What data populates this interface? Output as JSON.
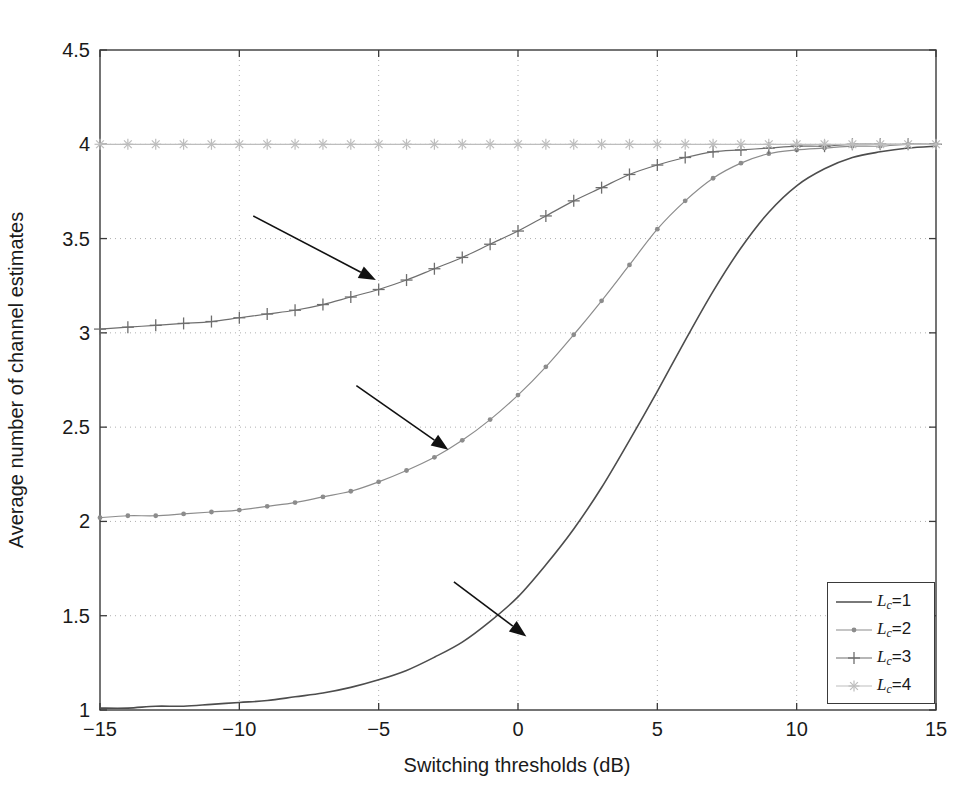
{
  "chart_data": {
    "type": "line",
    "title": "",
    "xlabel": "Switching thresholds (dB)",
    "ylabel": "Average number of channel estimates",
    "xlim": [
      -15,
      15
    ],
    "ylim": [
      1,
      4.5
    ],
    "xticks": [
      -15,
      -10,
      -5,
      0,
      5,
      10,
      15
    ],
    "xtick_labels": [
      "-15",
      "-10",
      "-5",
      "0",
      "5",
      "10",
      "15"
    ],
    "yticks": [
      1,
      1.5,
      2,
      2.5,
      3,
      3.5,
      4,
      4.5
    ],
    "ytick_labels": [
      "1",
      "1.5",
      "2",
      "2.5",
      "3",
      "3.5",
      "4",
      "4.5"
    ],
    "grid": true,
    "grid_style": "dotted",
    "legend_position": "lower-right",
    "x": [
      -15,
      -14,
      -13,
      -12,
      -11,
      -10,
      -9,
      -8,
      -7,
      -6,
      -5,
      -4,
      -3,
      -2,
      -1,
      0,
      1,
      2,
      3,
      4,
      5,
      6,
      7,
      8,
      9,
      10,
      11,
      12,
      13,
      14,
      15
    ],
    "series": [
      {
        "name": "Lc=1",
        "label_base": "L",
        "label_sub": "c",
        "label_value": "1",
        "marker": "none",
        "line": "solid",
        "color": "#4d4d4d",
        "values": [
          1.01,
          1.01,
          1.02,
          1.02,
          1.03,
          1.04,
          1.05,
          1.07,
          1.09,
          1.12,
          1.16,
          1.21,
          1.28,
          1.36,
          1.47,
          1.6,
          1.77,
          1.96,
          2.18,
          2.43,
          2.69,
          2.96,
          3.22,
          3.45,
          3.64,
          3.78,
          3.87,
          3.93,
          3.96,
          3.98,
          3.99
        ]
      },
      {
        "name": "Lc=2",
        "label_base": "L",
        "label_sub": "c",
        "label_value": "2",
        "marker": "dot",
        "line": "solid",
        "color": "#8c8c8c",
        "values": [
          2.02,
          2.03,
          2.03,
          2.04,
          2.05,
          2.06,
          2.08,
          2.1,
          2.13,
          2.16,
          2.21,
          2.27,
          2.34,
          2.43,
          2.54,
          2.67,
          2.82,
          2.99,
          3.17,
          3.36,
          3.55,
          3.7,
          3.82,
          3.9,
          3.95,
          3.97,
          3.98,
          3.99,
          3.99,
          4.0,
          4.0
        ]
      },
      {
        "name": "Lc=3",
        "label_base": "L",
        "label_sub": "c",
        "label_value": "3",
        "marker": "plus",
        "line": "solid",
        "color": "#6e6e6e",
        "values": [
          3.02,
          3.03,
          3.04,
          3.05,
          3.06,
          3.08,
          3.1,
          3.12,
          3.15,
          3.19,
          3.23,
          3.28,
          3.34,
          3.4,
          3.47,
          3.54,
          3.62,
          3.7,
          3.77,
          3.84,
          3.89,
          3.93,
          3.96,
          3.97,
          3.98,
          3.99,
          3.99,
          4.0,
          4.0,
          4.0,
          4.0
        ]
      },
      {
        "name": "Lc=4",
        "label_base": "L",
        "label_sub": "c",
        "label_value": "4",
        "marker": "star",
        "line": "solid",
        "color": "#bdbdbd",
        "values": [
          4.0,
          4.0,
          4.0,
          4.0,
          4.0,
          4.0,
          4.0,
          4.0,
          4.0,
          4.0,
          4.0,
          4.0,
          4.0,
          4.0,
          4.0,
          4.0,
          4.0,
          4.0,
          4.0,
          4.0,
          4.0,
          4.0,
          4.0,
          4.0,
          4.0,
          4.0,
          4.0,
          4.0,
          4.0,
          4.0,
          4.0
        ]
      }
    ],
    "annotations": [
      {
        "name": "arrow-to-lc3",
        "from_x": -9.5,
        "from_y": 3.62,
        "to_x": -5.1,
        "to_y": 3.28
      },
      {
        "name": "arrow-to-lc2",
        "from_x": -5.8,
        "from_y": 2.72,
        "to_x": -2.5,
        "to_y": 2.38
      },
      {
        "name": "arrow-to-lc1",
        "from_x": -2.3,
        "from_y": 1.68,
        "to_x": 0.3,
        "to_y": 1.39
      }
    ]
  },
  "legend": {
    "entries": [
      {
        "text_base": "L",
        "text_sub": "c",
        "text_eq": "=1"
      },
      {
        "text_base": "L",
        "text_sub": "c",
        "text_eq": "=2"
      },
      {
        "text_base": "L",
        "text_sub": "c",
        "text_eq": "=3"
      },
      {
        "text_base": "L",
        "text_sub": "c",
        "text_eq": "=4"
      }
    ]
  },
  "colors": {
    "axis": "#3a3a3a",
    "grid": "#b0b0b0",
    "annotation": "#111111",
    "background": "#ffffff"
  }
}
